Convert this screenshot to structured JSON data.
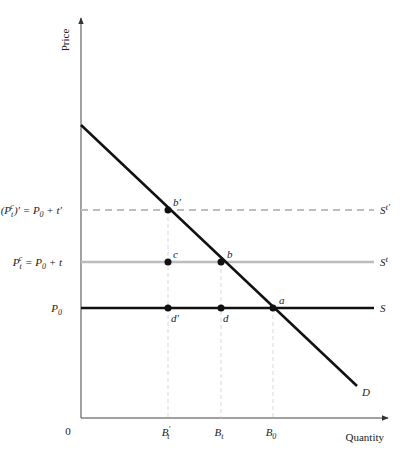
{
  "diagram": {
    "type": "supply-demand-tax",
    "axes": {
      "y_label": "Price",
      "x_label": "Quantity",
      "origin_label": "0"
    },
    "price_levels": [
      {
        "id": "p_tprime",
        "label_html": "(P_t^c)' = P_0 + t'",
        "label_main": "(P",
        "label_sub": "t",
        "label_sup": "c",
        "label_rest": ")′ = P",
        "label_sub2": "0",
        "label_tail": " + t′",
        "y": 210,
        "line_label": "S",
        "line_sup": "t′",
        "style": "dashed",
        "color": "#bdbdbd"
      },
      {
        "id": "p_t",
        "label_main": "P",
        "label_sub": "t",
        "label_sup": "c",
        "label_rest": " = P",
        "label_sub2": "0",
        "label_tail": " + t",
        "y": 262,
        "line_label": "S",
        "line_sup": "t",
        "style": "solid",
        "color": "#bdbdbd"
      },
      {
        "id": "p_0",
        "label_main": "P",
        "label_sub": "0",
        "y": 308,
        "line_label": "S",
        "style": "solid",
        "color": "#111111"
      }
    ],
    "quantity_levels": [
      {
        "id": "b_tprime",
        "label": "B",
        "sub": "t",
        "prime": "′",
        "x": 168
      },
      {
        "id": "b_t",
        "label": "B",
        "sub": "t",
        "prime": "",
        "x": 221
      },
      {
        "id": "b_0",
        "label": "B",
        "sub": "0",
        "prime": "",
        "x": 273
      }
    ],
    "demand": {
      "label": "D",
      "x1": 81,
      "y1": 125,
      "x2": 357,
      "y2": 386
    },
    "points": [
      {
        "name": "b′",
        "x": 168,
        "y": 210
      },
      {
        "name": "c",
        "x": 168,
        "y": 262
      },
      {
        "name": "b",
        "x": 221,
        "y": 262
      },
      {
        "name": "a",
        "x": 273,
        "y": 308
      },
      {
        "name": "d′",
        "x": 168,
        "y": 308
      },
      {
        "name": "d",
        "x": 221,
        "y": 308
      }
    ]
  }
}
